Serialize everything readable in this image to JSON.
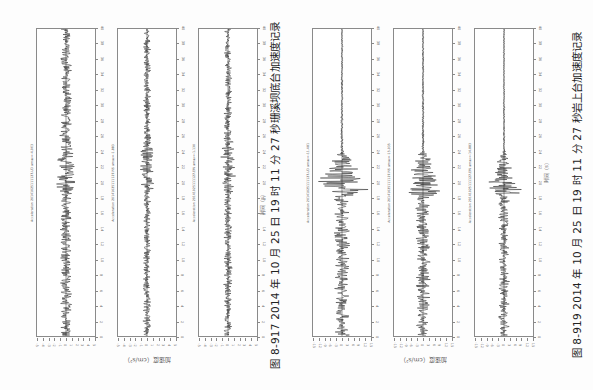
{
  "figures": [
    {
      "id": "fig-8-917",
      "caption": "图 8-917   2014 年 10 月 25 日 19 时 11 分 27 秒珊溪坝底台加速度记录",
      "ylabel": "加速度（cm/s²）",
      "xlabel": "时间（s）",
      "plots": [
        {
          "title": "Acceleration 20141025111127.UD  amax=-4.063",
          "envelope": "long",
          "peak": 0.62,
          "onset": 0.52
        },
        {
          "title": "Acceleration 20141025111127.NS  amax=-1.883",
          "envelope": "long",
          "peak": 0.42,
          "onset": 0.52
        },
        {
          "title": "Acceleration 20141025111127.EW  amax=-1.130",
          "envelope": "long",
          "peak": 0.45,
          "onset": 0.52
        }
      ]
    },
    {
      "id": "fig-8-919",
      "caption": "图 8-919   2014 年 10 月 25 日 19 时 11 分 27 秒岩上台加速度记录",
      "ylabel": "加速度（cm/s²）",
      "xlabel": "时间（s）",
      "plots": [
        {
          "title": "Acceleration 20141025111127.UD  amax=-11.481",
          "envelope": "short",
          "peak": 0.82,
          "onset": 0.535
        },
        {
          "title": "Acceleration 20141025111127.NS  amax=-15.035",
          "envelope": "short",
          "peak": 0.78,
          "onset": 0.535
        },
        {
          "title": "Acceleration 20141025111127.EW  amax=-14.883",
          "envelope": "short",
          "peak": 0.55,
          "onset": 0.535
        }
      ]
    }
  ],
  "time_ticks": [
    "0",
    "2",
    "4",
    "6",
    "8",
    "10",
    "12",
    "14",
    "16",
    "18",
    "20",
    "22",
    "24",
    "26",
    "28",
    "30",
    "32",
    "34",
    "36",
    "38",
    "40"
  ],
  "amp_ticks_left": [
    "-5",
    "-4",
    "-3",
    "-2",
    "-1",
    "0",
    "1",
    "2",
    "3",
    "4",
    "5"
  ],
  "amp_ticks_right": [
    "-15",
    "-12",
    "-9",
    "-6",
    "-3",
    "0",
    "3",
    "6",
    "9",
    "12",
    "15"
  ],
  "colors": {
    "trace": "#1a1a1a",
    "frame": "#8a8a8a",
    "text": "#222222"
  }
}
